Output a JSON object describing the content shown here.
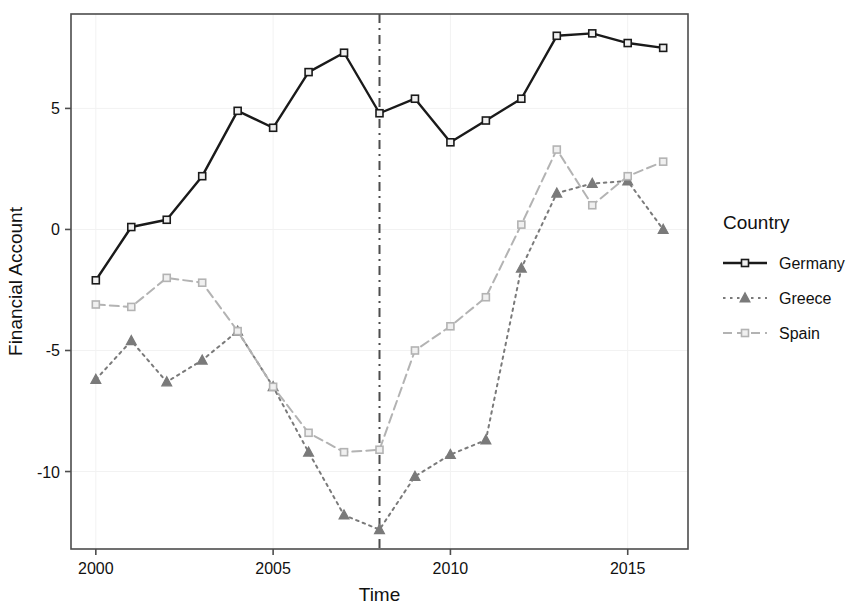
{
  "chart_data": {
    "type": "line",
    "title": "",
    "xlabel": "Time",
    "ylabel": "Financial Account",
    "x": [
      2000,
      2001,
      2002,
      2003,
      2004,
      2005,
      2006,
      2007,
      2008,
      2009,
      2010,
      2011,
      2012,
      2013,
      2014,
      2015,
      2016
    ],
    "xlim": [
      1999.3,
      2016.7
    ],
    "ylim": [
      -13.2,
      8.9
    ],
    "xticks": [
      2000,
      2005,
      2010,
      2015
    ],
    "xtick_labels": [
      "2000",
      "2005",
      "2010",
      "2015"
    ],
    "yticks": [
      5,
      0,
      -5,
      -10
    ],
    "ytick_labels": [
      "5",
      "0",
      "-5",
      "-10"
    ],
    "grid": "minor-light",
    "legend_position": "right",
    "legend_title": "Country",
    "annotations": [
      {
        "name": "crisis-marker-2008",
        "type": "vline",
        "x": 2008,
        "style": "dashdot",
        "color": "#4d4d4d"
      }
    ],
    "series": [
      {
        "name": "Germany",
        "color": "#1a1a1a",
        "linestyle": "solid",
        "marker": "square",
        "values": [
          -2.1,
          0.1,
          0.4,
          2.2,
          4.9,
          4.2,
          6.5,
          7.3,
          4.8,
          5.4,
          3.6,
          4.5,
          5.4,
          8.0,
          8.1,
          7.7,
          7.5
        ]
      },
      {
        "name": "Greece",
        "color": "#7a7a7a",
        "linestyle": "dotted",
        "marker": "triangle",
        "values": [
          -6.2,
          -4.6,
          -6.3,
          -5.4,
          -4.2,
          -6.5,
          -9.2,
          -11.8,
          -12.4,
          -10.2,
          -9.3,
          -8.7,
          -1.6,
          1.5,
          1.9,
          2.0,
          0.0
        ]
      },
      {
        "name": "Spain",
        "color": "#b3b3b3",
        "linestyle": "dashed",
        "marker": "square",
        "values": [
          -3.1,
          -3.2,
          -2.0,
          -2.2,
          -4.2,
          -6.5,
          -8.4,
          -9.2,
          -9.1,
          -5.0,
          -4.0,
          -2.8,
          0.2,
          3.3,
          1.0,
          2.2,
          2.8
        ]
      }
    ]
  },
  "legend": {
    "title": "Country",
    "entries": [
      {
        "label": "Germany"
      },
      {
        "label": "Greece"
      },
      {
        "label": "Spain"
      }
    ]
  },
  "axes": {
    "x_title": "Time",
    "y_title": "Financial Account"
  }
}
